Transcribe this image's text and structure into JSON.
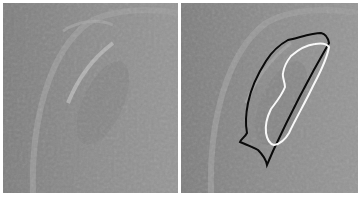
{
  "figure": {
    "panels": [
      {
        "id": "left",
        "description": "Grayscale ultrasound image, unannotated",
        "contours": []
      },
      {
        "id": "right",
        "description": "Same grayscale ultrasound image with segmentation contours overlaid",
        "contours": [
          {
            "name": "outer-contour",
            "color": "#000000"
          },
          {
            "name": "inner-contour",
            "color": "#ffffff"
          }
        ]
      }
    ],
    "colors": {
      "background": "#ffffff",
      "image_gray": "#8a8a8a",
      "outer_contour": "#000000",
      "inner_contour": "#ffffff"
    }
  }
}
